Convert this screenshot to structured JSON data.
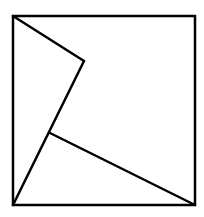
{
  "diagram": {
    "type": "geometric-figure",
    "stroke_color": "#000000",
    "background_color": "#ffffff",
    "stroke_width": 2.5,
    "square": {
      "x1": 13,
      "y1": 16,
      "x2": 195,
      "y2": 205
    },
    "points": {
      "A": [
        13,
        16
      ],
      "B": [
        195,
        16
      ],
      "C": [
        195,
        205
      ],
      "D": [
        13,
        205
      ],
      "E": [
        84,
        61
      ],
      "F": [
        50,
        133
      ]
    },
    "segments": [
      {
        "from": "A",
        "to": "E"
      },
      {
        "from": "E",
        "to": "D"
      },
      {
        "from": "F",
        "to": "C"
      }
    ]
  }
}
